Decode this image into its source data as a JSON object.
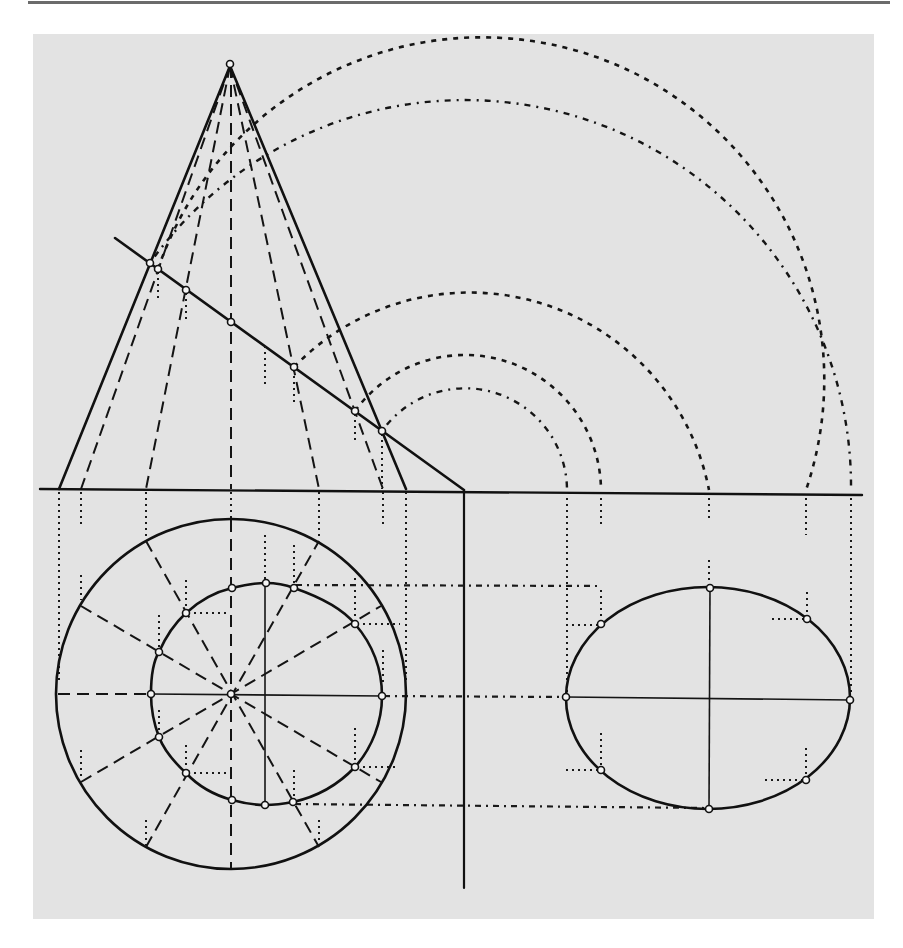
{
  "figure": {
    "views": [
      "front-view",
      "top-view",
      "true-shape-view"
    ],
    "colors": {
      "paper": "#ffffff",
      "panel": "#e3e3e3",
      "ink": "#111111",
      "rule": "#6b6b6b"
    }
  },
  "geometry": {
    "apex": [
      230,
      64
    ],
    "ground_line": {
      "from": [
        40,
        489
      ],
      "to": [
        862,
        495
      ]
    },
    "cone_base": {
      "left": [
        59,
        489
      ],
      "right": [
        406,
        489
      ]
    },
    "generator_feet_x": [
      81,
      146,
      231,
      319,
      383
    ],
    "cutting_plane": {
      "from": [
        115,
        238
      ],
      "to": [
        464,
        490
      ]
    },
    "cut_points": [
      [
        150,
        263
      ],
      [
        158,
        269
      ],
      [
        186,
        290
      ],
      [
        231,
        322
      ],
      [
        294,
        367
      ],
      [
        355,
        411
      ],
      [
        382,
        431
      ]
    ],
    "arc_center": [
      465,
      490
    ],
    "arc_radii": [
      102,
      136,
      244,
      341,
      386
    ],
    "axis_line": {
      "x": 464,
      "y1": 491,
      "y2": 888
    },
    "top_circle": {
      "cx": 231,
      "cy": 694,
      "r": 175
    },
    "section_points_top": [
      [
        151,
        694
      ],
      [
        159,
        652
      ],
      [
        186,
        613
      ],
      [
        232,
        588
      ],
      [
        266,
        583
      ],
      [
        294,
        588
      ],
      [
        355,
        624
      ],
      [
        382,
        696
      ],
      [
        355,
        767
      ],
      [
        293,
        802
      ],
      [
        265,
        805
      ],
      [
        232,
        800
      ],
      [
        186,
        773
      ],
      [
        159,
        737
      ]
    ],
    "true_shape_ellipse": {
      "cx": 708,
      "cy": 698,
      "rx": 142,
      "ry": 111
    },
    "ellipse_points": [
      [
        566,
        697
      ],
      [
        601,
        624
      ],
      [
        710,
        588
      ],
      [
        807,
        619
      ],
      [
        850,
        700
      ],
      [
        806,
        780
      ],
      [
        709,
        809
      ],
      [
        601,
        770
      ]
    ],
    "projection_levels_y": [
      586,
      697,
      808
    ]
  }
}
